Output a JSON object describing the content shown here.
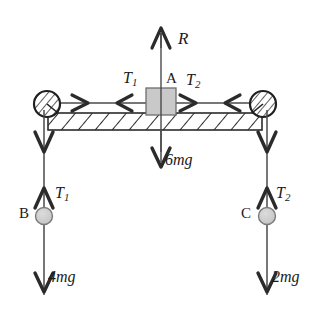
{
  "figure": {
    "type": "free-body-diagram",
    "colors": {
      "stroke": "#2b2b2b",
      "line": "#4a4a4a",
      "block_fill": "#c9c9c9",
      "mass_fill": "#cfcfcf",
      "beam_fill": "#ffffff",
      "background": "#ffffff"
    }
  },
  "labels": {
    "normal_reaction": "R",
    "block_name": "A",
    "tension_left_top": {
      "symbol": "T",
      "sub": "1"
    },
    "tension_right_top": {
      "symbol": "T",
      "sub": "2"
    },
    "weight_beam": "6mg",
    "tension_at_B": {
      "symbol": "T",
      "sub": "1"
    },
    "mass_b_name": "B",
    "weight_b": "4mg",
    "tension_at_C": {
      "symbol": "T",
      "sub": "2"
    },
    "mass_c_name": "C",
    "weight_c": "2mg"
  },
  "forces": [
    {
      "name": "R",
      "direction": "up",
      "applied_to": "beam",
      "magnitude_text": "R"
    },
    {
      "name": "T1",
      "direction": "left",
      "applied_to": "block-A",
      "magnitude_text": "T1"
    },
    {
      "name": "T2",
      "direction": "right",
      "applied_to": "block-A",
      "magnitude_text": "T2"
    },
    {
      "name": "6mg",
      "direction": "down",
      "applied_to": "beam",
      "magnitude_text": "6mg"
    },
    {
      "name": "T1",
      "direction": "up",
      "applied_to": "mass-B",
      "magnitude_text": "T1"
    },
    {
      "name": "4mg",
      "direction": "down",
      "applied_to": "mass-B",
      "magnitude_text": "4mg"
    },
    {
      "name": "T2",
      "direction": "up",
      "applied_to": "mass-C",
      "magnitude_text": "T2"
    },
    {
      "name": "2mg",
      "direction": "down",
      "applied_to": "mass-C",
      "magnitude_text": "2mg"
    }
  ],
  "components": {
    "pulley_left": "pulley",
    "pulley_right": "pulley",
    "beam": "hatched-beam",
    "block": "block-A",
    "mass_b": "mass-B",
    "mass_c": "mass-C"
  }
}
